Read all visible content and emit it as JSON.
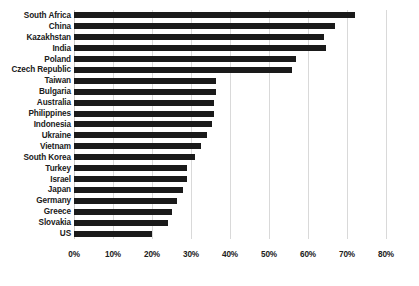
{
  "chart_data": {
    "type": "bar",
    "orientation": "horizontal",
    "title": "",
    "subtitle": "",
    "xlabel": "",
    "ylabel": "",
    "xlim": [
      0,
      80
    ],
    "xtick_labels": [
      "0%",
      "10%",
      "20%",
      "30%",
      "40%",
      "50%",
      "60%",
      "70%",
      "80%"
    ],
    "xtick_values": [
      0,
      10,
      20,
      30,
      40,
      50,
      60,
      70,
      80
    ],
    "grid": "vertical",
    "legend": "none",
    "value_unit": "%",
    "bar_color": "#1a1a1a",
    "gridline_color": "#d9d9d9",
    "categories": [
      "South Africa",
      "China",
      "Kazakhstan",
      "India",
      "Poland",
      "Czech Republic",
      "Taiwan",
      "Bulgaria",
      "Australia",
      "Philippines",
      "Indonesia",
      "Ukraine",
      "Vietnam",
      "South Korea",
      "Turkey",
      "Israel",
      "Japan",
      "Germany",
      "Greece",
      "Slovakia",
      "US"
    ],
    "values": [
      72,
      67,
      64,
      64.5,
      57,
      56,
      36.5,
      36.5,
      36,
      36,
      35.5,
      34,
      32.5,
      31,
      29,
      29,
      28,
      26.5,
      25,
      24,
      20
    ]
  }
}
